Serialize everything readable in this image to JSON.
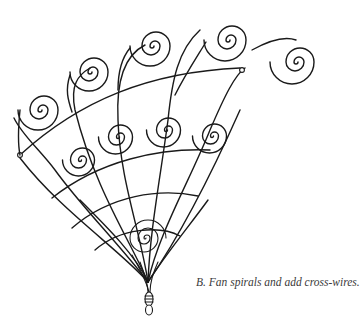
{
  "figure": {
    "caption": "B. Fan spirals and add cross-wires.",
    "line_color": "#1a1a1a",
    "background": "#ffffff"
  }
}
